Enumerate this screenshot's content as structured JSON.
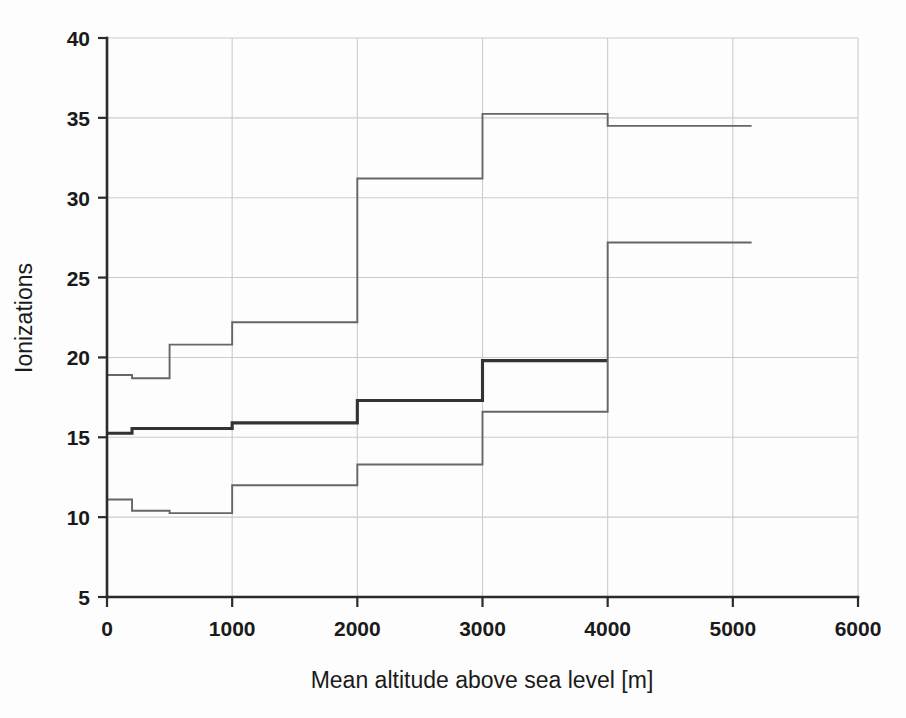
{
  "chart_data": {
    "type": "line",
    "title": "",
    "xlabel": "Mean altitude above sea level [m]",
    "ylabel": "Ionizations",
    "xlim": [
      0,
      6000
    ],
    "ylim": [
      5,
      40
    ],
    "xticks": [
      0,
      1000,
      2000,
      3000,
      4000,
      5000,
      6000
    ],
    "yticks": [
      5,
      10,
      15,
      20,
      25,
      30,
      35,
      40
    ],
    "xtick_labels": [
      "0",
      "1000",
      "2000",
      "3000",
      "4000",
      "5000",
      "6000"
    ],
    "ytick_labels": [
      "5",
      "10",
      "15",
      "20",
      "25",
      "30",
      "35",
      "40"
    ],
    "grid": true,
    "grid_axis": "both",
    "legend": "none",
    "drawstyle": "steps-post",
    "series": [
      {
        "name": "upper-band",
        "style": "thin",
        "color": "#666666",
        "x": [
          0,
          200,
          500,
          1000,
          2000,
          3000,
          4000,
          5150
        ],
        "values": [
          18.9,
          18.7,
          20.8,
          22.2,
          31.2,
          35.25,
          34.5,
          34.5
        ]
      },
      {
        "name": "central-curve",
        "style": "thick",
        "color": "#333333",
        "x": [
          0,
          200,
          1000,
          2000,
          3000,
          4000
        ],
        "values": [
          15.25,
          15.55,
          15.9,
          17.3,
          19.8,
          19.8
        ]
      },
      {
        "name": "lower-band",
        "style": "thin",
        "color": "#666666",
        "x": [
          0,
          200,
          500,
          1000,
          2000,
          3000,
          4000,
          5150
        ],
        "values": [
          11.1,
          10.4,
          10.25,
          12.0,
          13.3,
          16.6,
          27.2,
          27.2
        ]
      }
    ]
  },
  "axes": {
    "ylabel_text": "Ionizations",
    "xlabel_text": "Mean altitude above sea level [m]"
  },
  "colors": {
    "grid": "#cccccc",
    "spine": "#2b2b2b",
    "thin_series": "#666666",
    "thick_series": "#333333",
    "background": "#fdfdfd"
  }
}
